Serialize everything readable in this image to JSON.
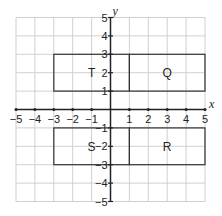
{
  "diagram": {
    "type": "coordinate-plane",
    "axes": {
      "x_label": "x",
      "y_label": "y",
      "x_range": [
        -5,
        5
      ],
      "y_range": [
        -5,
        5
      ],
      "x_ticks": [
        "−5",
        "−4",
        "−3",
        "−2",
        "−1",
        "1",
        "2",
        "3",
        "4",
        "5"
      ],
      "y_ticks": [
        "5",
        "4",
        "3",
        "2",
        "1",
        "−1",
        "−2",
        "−3",
        "−4",
        "−5"
      ]
    },
    "rectangles": [
      {
        "label": "T",
        "x1": -3,
        "y1": 1,
        "x2": 1,
        "y2": 3
      },
      {
        "label": "Q",
        "x1": 1,
        "y1": 1,
        "x2": 5,
        "y2": 3
      },
      {
        "label": "S",
        "x1": -3,
        "y1": -3,
        "x2": 1,
        "y2": -1
      },
      {
        "label": "R",
        "x1": 1,
        "y1": -3,
        "x2": 5,
        "y2": -1
      }
    ],
    "colors": {
      "grid": "#d0d0d0",
      "axis": "#222222",
      "rect_stroke": "#333333"
    }
  }
}
